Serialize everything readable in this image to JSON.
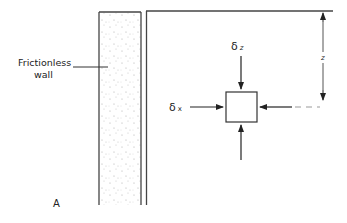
{
  "figure": {
    "panel_label": "A",
    "wall_label_line1": "Frictionless",
    "wall_label_line2": "wall",
    "delta_z_symbol": "δ",
    "delta_z_subscript": "z",
    "delta_x_symbol": "δ",
    "delta_x_subscript": "x",
    "depth_label": "z"
  },
  "colors": {
    "stroke": "#333333",
    "dashed": "#9a9a9a",
    "stipple": "#b0b0b0"
  }
}
